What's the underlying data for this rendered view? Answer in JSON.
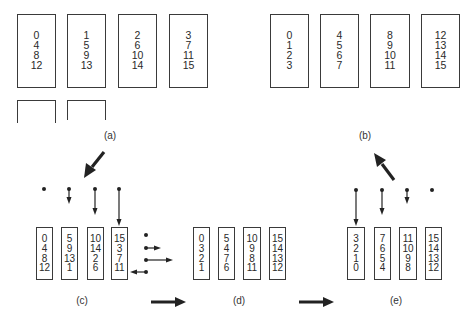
{
  "figure": {
    "panels": {
      "a": {
        "label": "(a)",
        "columns": [
          {
            "values": [
              "0",
              "4",
              "8",
              "12"
            ]
          },
          {
            "values": [
              "1",
              "5",
              "9",
              "13"
            ]
          },
          {
            "values": [
              "2",
              "6",
              "10",
              "14"
            ]
          },
          {
            "values": [
              "3",
              "7",
              "11",
              "15"
            ]
          }
        ],
        "empty_buffers": 2
      },
      "b": {
        "label": "(b)",
        "columns": [
          {
            "values": [
              "0",
              "1",
              "2",
              "3"
            ]
          },
          {
            "values": [
              "4",
              "5",
              "6",
              "7"
            ]
          },
          {
            "values": [
              "8",
              "9",
              "10",
              "11"
            ]
          },
          {
            "values": [
              "12",
              "13",
              "14",
              "15"
            ]
          }
        ]
      },
      "c": {
        "label": "(c)",
        "columns": [
          {
            "values": [
              "0",
              "4",
              "8",
              "12"
            ]
          },
          {
            "values": [
              "5",
              "9",
              "13",
              "1"
            ]
          },
          {
            "values": [
              "10",
              "14",
              "2",
              "6"
            ]
          },
          {
            "values": [
              "15",
              "3",
              "7",
              "11"
            ]
          }
        ],
        "shift_indicators": {
          "vertical": [
            "dot",
            "short-down",
            "medium-down",
            "long-down"
          ],
          "horizontal": [
            "dot",
            "short-right",
            "long-right",
            "short-left"
          ]
        }
      },
      "d": {
        "label": "(d)",
        "columns": [
          {
            "values": [
              "0",
              "3",
              "2",
              "1"
            ]
          },
          {
            "values": [
              "5",
              "4",
              "7",
              "6"
            ]
          },
          {
            "values": [
              "10",
              "9",
              "8",
              "11"
            ]
          },
          {
            "values": [
              "15",
              "14",
              "13",
              "12"
            ]
          }
        ]
      },
      "e": {
        "label": "(e)",
        "columns": [
          {
            "values": [
              "3",
              "2",
              "1",
              "0"
            ]
          },
          {
            "values": [
              "7",
              "6",
              "5",
              "4"
            ]
          },
          {
            "values": [
              "11",
              "10",
              "9",
              "8"
            ]
          },
          {
            "values": [
              "15",
              "14",
              "13",
              "12"
            ]
          }
        ],
        "shift_indicators": {
          "vertical": [
            "long-down",
            "medium-down",
            "short-down",
            "dot"
          ]
        }
      }
    },
    "flow": [
      "a",
      "c",
      "d",
      "e",
      "b"
    ],
    "colors": {
      "ink": "#2a2a2a",
      "background": "#ffffff"
    }
  }
}
